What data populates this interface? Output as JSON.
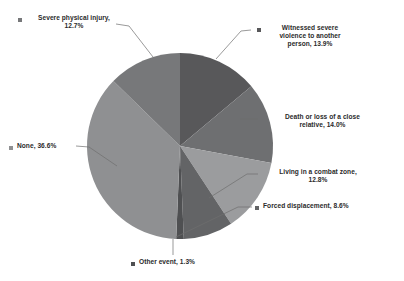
{
  "chart_data": {
    "type": "pie",
    "title": "",
    "xlabel": "",
    "ylabel": "",
    "legend_position": "callout-labels",
    "grid": false,
    "value_unit": "%",
    "categories": [
      "Witnessed severe violence to another person",
      "Death or loss of a close relative",
      "Living in a combat zone",
      "Forced displacement",
      "Other event",
      "None",
      "Severe physical injury"
    ],
    "values": [
      13.9,
      14.0,
      12.8,
      8.6,
      1.3,
      36.6,
      12.7
    ],
    "colors": [
      "#58585a",
      "#6e6f71",
      "#9b9c9e",
      "#636466",
      "#4f5052",
      "#8f9092",
      "#77787a"
    ],
    "slices": [
      {
        "id": "witnessed",
        "label": "Witnessed severe\nviolence to another\nperson,  13.9%",
        "name": "Witnessed severe violence to another person",
        "value": 13.9,
        "display_value": "13.9%",
        "color": "#58585a"
      },
      {
        "id": "death",
        "label": "Death or loss of a close\nrelative, 14.0%",
        "name": "Death or loss of a close relative",
        "value": 14.0,
        "display_value": "14.0%",
        "color": "#6e6f71"
      },
      {
        "id": "combat",
        "label": "Living in a combat zone,\n12.8%",
        "name": "Living in a combat zone",
        "value": 12.8,
        "display_value": "12.8%",
        "color": "#9b9c9e"
      },
      {
        "id": "displacement",
        "label": "Forced displacement, 8.6%",
        "name": "Forced displacement",
        "value": 8.6,
        "display_value": "8.6%",
        "color": "#636466"
      },
      {
        "id": "other",
        "label": "Other event,  1.3%",
        "name": "Other event",
        "value": 1.3,
        "display_value": "1.3%",
        "color": "#4f5052"
      },
      {
        "id": "none",
        "label": "None,  36.6%",
        "name": "None",
        "value": 36.6,
        "display_value": "36.6%",
        "color": "#8f9092"
      },
      {
        "id": "severe-injury",
        "label": "Severe physical injury,\n12.7%",
        "name": "Severe physical injury",
        "value": 12.7,
        "display_value": "12.7%",
        "color": "#77787a"
      }
    ]
  },
  "colors": {
    "background": "#ffffff",
    "leader_line": "#6f6f6f",
    "text": "#2b2b2b",
    "marker": "#595959"
  }
}
